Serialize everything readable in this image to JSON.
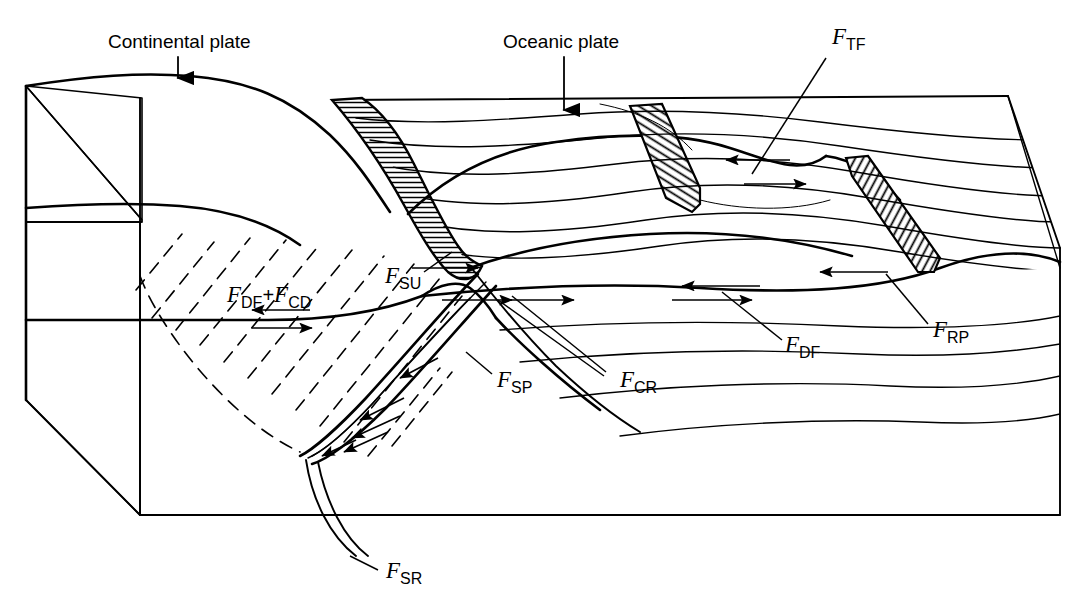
{
  "figure": {
    "background_color": "#ffffff",
    "line_color": "#000000",
    "dark_face_color": "#9a9a9a",
    "light_face_color": "#d2d2d2"
  },
  "annotations": {
    "continental_plate": {
      "label": "Continental plate",
      "x": 108,
      "y": 48,
      "pointer": "down-arrow"
    },
    "oceanic_plate": {
      "label": "Oceanic plate",
      "x": 503,
      "y": 48,
      "pointer": "down-arrow"
    }
  },
  "forces": [
    {
      "id": "FTF",
      "symbol": "F",
      "subscript": "TF",
      "name": "transform-fault-resistance",
      "label_x": 832,
      "label_y": 44,
      "leader": "M 826 56 L 757 170"
    },
    {
      "id": "FSU",
      "symbol": "F",
      "subscript": "SU",
      "name": "suction-force",
      "label_x": 391,
      "label_y": 283,
      "leader": "M 432 272 L 463 249"
    },
    {
      "id": "FDF_FCD",
      "symbol": "F",
      "subscript": "DF",
      "symbol2": "F",
      "subscript2": "CD",
      "plus": "+",
      "name": "drag-and-continental-drag-force",
      "label_x": 227,
      "label_y": 302
    },
    {
      "id": "FSP",
      "symbol": "F",
      "subscript": "SP",
      "name": "slab-pull-force",
      "label_x": 497,
      "label_y": 387,
      "leader": "M 493 374 L 466 354"
    },
    {
      "id": "FCR",
      "symbol": "F",
      "subscript": "CR",
      "name": "colliding-resistance-force",
      "label_x": 620,
      "label_y": 387,
      "leader": "M 614 372 L 512 295"
    },
    {
      "id": "FDF",
      "symbol": "F",
      "subscript": "DF",
      "name": "drag-force",
      "label_x": 785,
      "label_y": 352,
      "leader": "M 784 340 L 722 294"
    },
    {
      "id": "FRP",
      "symbol": "F",
      "subscript": "RP",
      "name": "ridge-push-force",
      "label_x": 933,
      "label_y": 337,
      "leader": "M 929 325 L 888 277"
    },
    {
      "id": "FSR",
      "symbol": "F",
      "subscript": "SR",
      "name": "slab-resistance-force",
      "label_x": 386,
      "label_y": 578,
      "leader": "M 381 568 L 352 553"
    }
  ],
  "structures": {
    "subducting_slab": "hatched curved band descending from trench",
    "ridge_slabs": "two hatched spreading-ridge bands on right",
    "mantle_flow": "curved streamlines in mantle",
    "continental_root": "dashed diagonal hatching beneath continental plate",
    "block_faces": "isometric block with dark and light shaded side faces"
  }
}
